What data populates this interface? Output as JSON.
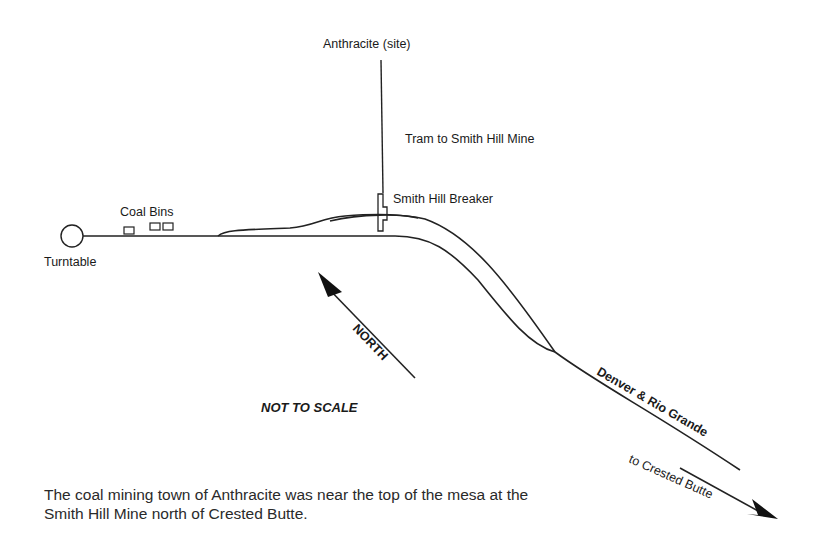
{
  "diagram": {
    "labels": {
      "anthracite_site": "Anthracite (site)",
      "tram": "Tram to Smith Hill Mine",
      "breaker": "Smith Hill Breaker",
      "coal_bins": "Coal Bins",
      "turntable": "Turntable",
      "north": "NORTH",
      "not_to_scale": "NOT TO SCALE",
      "railroad": "Denver & Rio Grande",
      "destination": "to Crested Butte"
    },
    "caption": "The coal mining town of Anthracite was near the top of the mesa at the Smith Hill Mine north of Crested Butte.",
    "colors": {
      "line": "#222222",
      "background": "#ffffff"
    }
  }
}
